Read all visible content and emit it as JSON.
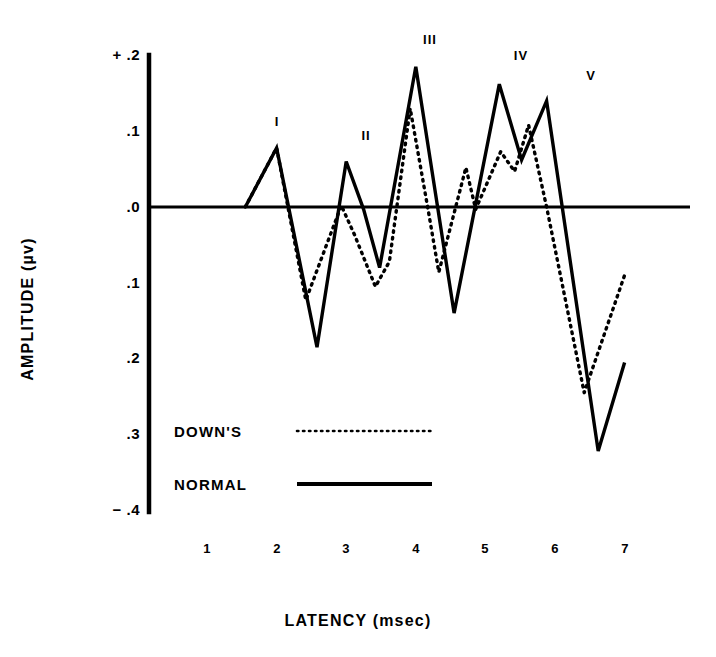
{
  "chart_data": {
    "type": "line",
    "title": "",
    "xlabel": "LATENCY  (msec)",
    "ylabel": "AMPLITUDE  (µv)",
    "xlim": [
      0.5,
      7.2
    ],
    "ylim": [
      -0.4,
      0.2
    ],
    "grid": false,
    "x_ticks": [
      1,
      2,
      3,
      4,
      5,
      6,
      7
    ],
    "x_tick_labels": [
      "1",
      "2",
      "3",
      "4",
      "5",
      "6",
      "7"
    ],
    "y_ticks": [
      0.2,
      0.1,
      0.0,
      -0.1,
      -0.2,
      -0.3,
      -0.4
    ],
    "y_tick_labels": [
      "+ .2",
      ".1",
      ".0",
      ".1",
      ".2",
      ".3",
      "− .4"
    ],
    "zero_line": 0.0,
    "legend_position": "center-left-inside",
    "series": [
      {
        "name": "DOWN'S",
        "style": "dotted",
        "color": "#000000",
        "points": [
          [
            1.55,
            0.0
          ],
          [
            2.0,
            0.078
          ],
          [
            2.42,
            -0.123
          ],
          [
            2.93,
            0.002
          ],
          [
            3.12,
            -0.037
          ],
          [
            3.42,
            -0.105
          ],
          [
            3.62,
            -0.072
          ],
          [
            3.92,
            0.13
          ],
          [
            4.18,
            -0.005
          ],
          [
            4.33,
            -0.086
          ],
          [
            4.72,
            0.052
          ],
          [
            4.86,
            -0.003
          ],
          [
            5.22,
            0.073
          ],
          [
            5.42,
            0.047
          ],
          [
            5.62,
            0.108
          ],
          [
            5.88,
            0.0
          ],
          [
            6.42,
            -0.245
          ],
          [
            7.0,
            -0.09
          ]
        ]
      },
      {
        "name": "NORMAL",
        "style": "solid",
        "color": "#000000",
        "points": [
          [
            1.55,
            0.0
          ],
          [
            2.0,
            0.078
          ],
          [
            2.58,
            -0.185
          ],
          [
            3.0,
            0.06
          ],
          [
            3.25,
            -0.003
          ],
          [
            3.48,
            -0.08
          ],
          [
            4.0,
            0.185
          ],
          [
            4.55,
            -0.14
          ],
          [
            5.2,
            0.162
          ],
          [
            5.52,
            0.062
          ],
          [
            5.88,
            0.14
          ],
          [
            6.62,
            -0.322
          ],
          [
            7.0,
            -0.205
          ]
        ]
      }
    ],
    "annotations": [
      {
        "text": "I",
        "x": 2.0,
        "y": 0.078
      },
      {
        "text": "II",
        "x": 3.0,
        "y": 0.06
      },
      {
        "text": "III",
        "x": 4.0,
        "y": 0.185
      },
      {
        "text": "IV",
        "x": 5.2,
        "y": 0.162
      },
      {
        "text": "V",
        "x": 5.88,
        "y": 0.14
      }
    ]
  },
  "legend": {
    "entries": [
      {
        "label": "DOWN'S",
        "style": "dotted"
      },
      {
        "label": "NORMAL",
        "style": "solid"
      }
    ]
  }
}
